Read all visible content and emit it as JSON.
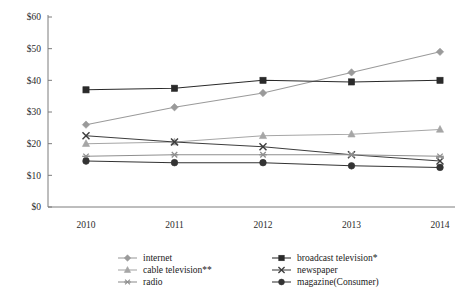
{
  "chart_data": {
    "type": "line",
    "title": "",
    "xlabel": "",
    "ylabel": "",
    "categories": [
      "2010",
      "2011",
      "2012",
      "2013",
      "2014"
    ],
    "x": [
      2010,
      2011,
      2012,
      2013,
      2014
    ],
    "ylim": [
      0,
      60
    ],
    "ytick_values": [
      0,
      10,
      20,
      30,
      40,
      50,
      60
    ],
    "ytick_labels": [
      "$0",
      "$10",
      "$20",
      "$30",
      "$40",
      "$50",
      "$60"
    ],
    "grid": false,
    "legend_position": "bottom",
    "value_prefix": "$",
    "series": [
      {
        "name": "internet",
        "marker": "diamond",
        "color": "#9a9a9a",
        "values": [
          26.0,
          31.5,
          36.0,
          42.5,
          49.0
        ]
      },
      {
        "name": "broadcast television*",
        "marker": "square",
        "color": "#2a2a2a",
        "values": [
          37.0,
          37.5,
          40.0,
          39.5,
          40.0
        ]
      },
      {
        "name": "cable television**",
        "marker": "triangle",
        "color": "#a6a6a6",
        "values": [
          20.0,
          20.5,
          22.5,
          23.0,
          24.5
        ]
      },
      {
        "name": "newspaper",
        "marker": "cross",
        "color": "#3d3d3d",
        "values": [
          22.5,
          20.5,
          19.0,
          16.5,
          14.5
        ]
      },
      {
        "name": "radio",
        "marker": "asterisk",
        "color": "#8f8f8f",
        "values": [
          16.0,
          16.5,
          16.5,
          16.5,
          16.0
        ]
      },
      {
        "name": "magazine(Consumer)",
        "marker": "circle",
        "color": "#333333",
        "values": [
          14.5,
          14.0,
          14.0,
          13.0,
          12.5
        ]
      }
    ]
  },
  "legend": {
    "entries": [
      {
        "label": "internet",
        "series_index": 0,
        "col": 0,
        "row": 0
      },
      {
        "label": "broadcast television*",
        "series_index": 1,
        "col": 1,
        "row": 0
      },
      {
        "label": "cable television**",
        "series_index": 2,
        "col": 0,
        "row": 1
      },
      {
        "label": "newspaper",
        "series_index": 3,
        "col": 1,
        "row": 1
      },
      {
        "label": "radio",
        "series_index": 4,
        "col": 0,
        "row": 2
      },
      {
        "label": "magazine(Consumer)",
        "series_index": 5,
        "col": 1,
        "row": 2
      }
    ]
  },
  "colors": {
    "axis": "#7d7d7d",
    "text": "#1a1a1a",
    "background": "#ffffff"
  }
}
